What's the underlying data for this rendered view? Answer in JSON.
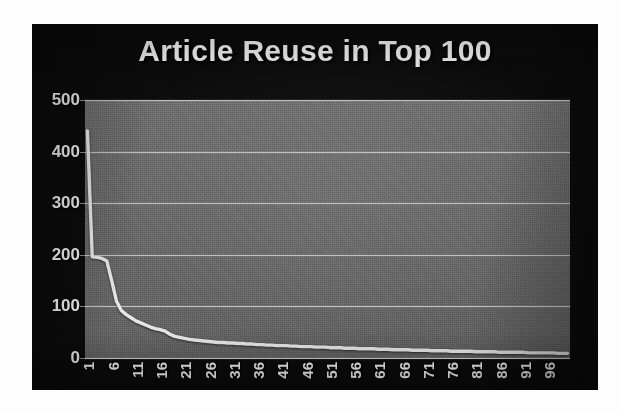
{
  "chart_data": {
    "type": "line",
    "title": "Article Reuse in Top 100",
    "xlabel": "",
    "ylabel": "",
    "ylim": [
      0,
      500
    ],
    "xlim": [
      1,
      100
    ],
    "grid": true,
    "legend": false,
    "yticks": [
      500,
      400,
      300,
      200,
      100,
      0
    ],
    "xticks": [
      1,
      6,
      11,
      16,
      21,
      26,
      31,
      36,
      41,
      46,
      51,
      56,
      61,
      66,
      71,
      76,
      81,
      86,
      91,
      96
    ],
    "series": [
      {
        "name": "Article reuse count",
        "x": [
          1,
          2,
          3,
          4,
          5,
          6,
          7,
          8,
          9,
          10,
          11,
          12,
          13,
          14,
          15,
          16,
          17,
          18,
          19,
          20,
          21,
          22,
          23,
          24,
          25,
          26,
          27,
          28,
          29,
          30,
          31,
          32,
          33,
          34,
          35,
          36,
          37,
          38,
          39,
          40,
          41,
          42,
          43,
          44,
          45,
          46,
          47,
          48,
          49,
          50,
          51,
          52,
          53,
          54,
          55,
          56,
          57,
          58,
          59,
          60,
          61,
          62,
          63,
          64,
          65,
          66,
          67,
          68,
          69,
          70,
          71,
          72,
          73,
          74,
          75,
          76,
          77,
          78,
          79,
          80,
          81,
          82,
          83,
          84,
          85,
          86,
          87,
          88,
          89,
          90,
          91,
          92,
          93,
          94,
          95,
          96,
          97,
          98,
          99,
          100
        ],
        "values": [
          440,
          196,
          195,
          193,
          188,
          150,
          110,
          92,
          84,
          78,
          72,
          68,
          64,
          60,
          57,
          55,
          52,
          46,
          42,
          40,
          38,
          36,
          35,
          34,
          33,
          32,
          31,
          30,
          30,
          29,
          29,
          28,
          28,
          27,
          27,
          26,
          26,
          25,
          25,
          24,
          24,
          24,
          23,
          23,
          22,
          22,
          22,
          21,
          21,
          21,
          20,
          20,
          20,
          19,
          19,
          19,
          18,
          18,
          18,
          18,
          17,
          17,
          17,
          16,
          16,
          16,
          16,
          15,
          15,
          15,
          15,
          14,
          14,
          14,
          14,
          13,
          13,
          13,
          13,
          13,
          12,
          12,
          12,
          12,
          12,
          11,
          11,
          11,
          11,
          11,
          11,
          10,
          10,
          10,
          10,
          10,
          10,
          9,
          9,
          9
        ]
      }
    ],
    "annotations": []
  },
  "colors": {
    "frame_background": "#0b0b0b",
    "plot_background": "#6a6a6a",
    "line": "#e6e6e6",
    "gridline": "#e2e2e2",
    "text": "#f1f1f1",
    "page_background": "#ffffff"
  }
}
